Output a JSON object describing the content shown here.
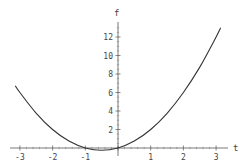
{
  "chart_data": {
    "type": "line",
    "title": "",
    "xlabel": "t",
    "ylabel": "f",
    "xlim": [
      -3.3,
      3.3
    ],
    "ylim": [
      -0.5,
      13.5
    ],
    "grid": false,
    "legend": null,
    "x_ticks": [
      -3,
      -2,
      -1,
      0,
      1,
      2,
      3
    ],
    "y_ticks": [
      2,
      4,
      6,
      8,
      10,
      12
    ],
    "x_tick_labels": [
      "-3",
      "-2",
      "-1",
      "0",
      "1",
      "2",
      "3"
    ],
    "y_tick_labels": [
      "2",
      "4",
      "6",
      "8",
      "10",
      "12"
    ],
    "x_tick_labels_visible": [
      "-3",
      "-2",
      "-1",
      "1",
      "2",
      "3"
    ],
    "series": [
      {
        "name": "f(t)",
        "color": "#333333",
        "x": [
          -3.14,
          -3.0,
          -2.5,
          -2.0,
          -1.5,
          -1.0,
          -0.5,
          0.0,
          0.5,
          1.0,
          1.5,
          2.0,
          2.5,
          3.0,
          3.14
        ],
        "values": [
          6.73,
          6.0,
          3.75,
          2.0,
          0.75,
          0.0,
          -0.25,
          0.0,
          0.75,
          2.0,
          3.75,
          6.0,
          8.75,
          12.0,
          13.0
        ]
      }
    ]
  },
  "labels": {
    "x_axis": "t",
    "y_axis": "f"
  }
}
